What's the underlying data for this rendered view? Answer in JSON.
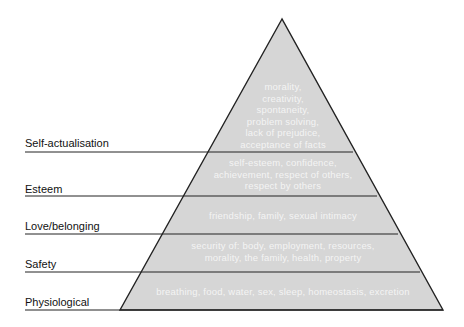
{
  "diagram": {
    "fill_color": "#d6d6d6",
    "line_color": "#222222",
    "levels": [
      {
        "label": "Self-actualisation",
        "content": [
          "morality,",
          "creativity,",
          "spontaneity,",
          "problem solving,",
          "lack of prejudice,",
          "acceptance of facts"
        ]
      },
      {
        "label": "Esteem",
        "content": [
          "self-esteem, confidence,",
          "achievement, respect of others,",
          "respect by others"
        ]
      },
      {
        "label": "Love/belonging",
        "content": [
          "friendship, family, sexual intimacy"
        ]
      },
      {
        "label": "Safety",
        "content": [
          "security of: body, employment, resources,",
          "morality, the family, health, property"
        ]
      },
      {
        "label": "Physiological",
        "content": [
          "breathing, food, water, sex, sleep, homeostasis, excretion"
        ]
      }
    ]
  }
}
